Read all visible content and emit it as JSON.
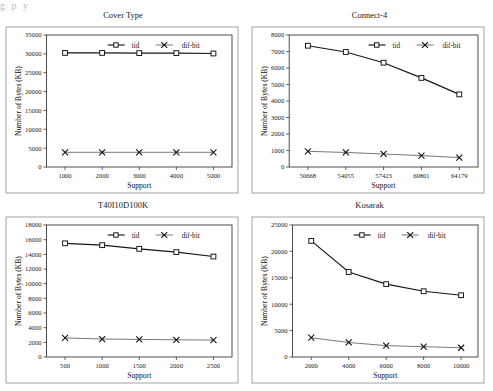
{
  "page": {
    "top_cutoff_text": "g           p           y",
    "axis_x_title": "Support",
    "axis_y_title": "Number of Bytes (KB)",
    "series_names": {
      "tid": "tid",
      "difbit": "dif-bit"
    },
    "colors": {
      "tid": "#161616",
      "difbit": "#4a4a4a",
      "frame": "#8d8d93",
      "axis": "#3b3b3b",
      "background": "#ffffff"
    }
  },
  "chart_data": [
    {
      "type": "line",
      "title": "Cover Type",
      "xlabel": "Support",
      "ylabel": "Number of Bytes (KB)",
      "x": [
        1000,
        2000,
        3000,
        4000,
        5000
      ],
      "xticklabels": [
        "1000",
        "2000",
        "3000",
        "4000",
        "5000"
      ],
      "xlim": [
        500,
        5500
      ],
      "ylim": [
        0,
        35000
      ],
      "yticks": [
        0,
        5000,
        10000,
        15000,
        20000,
        25000,
        30000,
        35000
      ],
      "yticklabels": [
        "0",
        "5000",
        "10000",
        "15000",
        "20000",
        "25000",
        "30000",
        "35000"
      ],
      "grid": false,
      "legend_position": "top-center",
      "series": [
        {
          "name": "tid",
          "marker": "square",
          "values": [
            30250,
            30250,
            30200,
            30200,
            30100
          ]
        },
        {
          "name": "dif-bit",
          "marker": "x",
          "values": [
            3900,
            3900,
            3900,
            3900,
            3900
          ]
        }
      ]
    },
    {
      "type": "line",
      "title": "Connect-4",
      "xlabel": "Support",
      "ylabel": "Number of Bytes (KB)",
      "x": [
        50668,
        54055,
        57423,
        60801,
        64179
      ],
      "xticklabels": [
        "50668",
        "54055",
        "57423",
        "60801",
        "64179"
      ],
      "xlim": [
        49000,
        65850
      ],
      "ylim": [
        0,
        8000
      ],
      "yticks": [
        0,
        1000,
        2000,
        3000,
        4000,
        5000,
        6000,
        7000,
        8000
      ],
      "yticklabels": [
        "0",
        "1000",
        "2000",
        "3000",
        "4000",
        "5000",
        "6000",
        "7000",
        "8000"
      ],
      "grid": false,
      "legend_position": "top-right",
      "series": [
        {
          "name": "tid",
          "marker": "square",
          "values": [
            7350,
            6970,
            6320,
            5400,
            4400
          ]
        },
        {
          "name": "dif-bit",
          "marker": "x",
          "values": [
            950,
            880,
            790,
            690,
            570
          ]
        }
      ]
    },
    {
      "type": "line",
      "title": "T40I10D100K",
      "xlabel": "Support",
      "ylabel": "Number of Bytes (KB)",
      "x": [
        500,
        1000,
        1500,
        2000,
        2500
      ],
      "xticklabels": [
        "500",
        "1000",
        "1500",
        "2000",
        "2500"
      ],
      "xlim": [
        250,
        2750
      ],
      "ylim": [
        0,
        18000
      ],
      "yticks": [
        0,
        2000,
        4000,
        6000,
        8000,
        10000,
        12000,
        14000,
        16000,
        18000
      ],
      "yticklabels": [
        "0",
        "2000",
        "4000",
        "6000",
        "8000",
        "10000",
        "12000",
        "14000",
        "16000",
        "18000"
      ],
      "grid": false,
      "legend_position": "top-center",
      "series": [
        {
          "name": "tid",
          "marker": "square",
          "values": [
            15500,
            15250,
            14750,
            14300,
            13700
          ]
        },
        {
          "name": "dif-bit",
          "marker": "x",
          "values": [
            2600,
            2450,
            2400,
            2350,
            2300
          ]
        }
      ]
    },
    {
      "type": "line",
      "title": "Kosarak",
      "xlabel": "Support",
      "ylabel": "Number of Bytes (KB)",
      "x": [
        2000,
        4000,
        6000,
        8000,
        10000
      ],
      "xticklabels": [
        "2000",
        "4000",
        "6000",
        "8000",
        "10000"
      ],
      "xlim": [
        1000,
        10900
      ],
      "ylim": [
        0,
        25000
      ],
      "yticks": [
        0,
        5000,
        10000,
        15000,
        20000,
        25000
      ],
      "yticklabels": [
        "0",
        "5000",
        "10000",
        "15000",
        "20000",
        "25000"
      ],
      "grid": false,
      "legend_position": "top-center",
      "series": [
        {
          "name": "tid",
          "marker": "square",
          "values": [
            22000,
            16100,
            13800,
            12450,
            11700
          ]
        },
        {
          "name": "dif-bit",
          "marker": "x",
          "values": [
            3650,
            2750,
            2150,
            1950,
            1750
          ]
        }
      ]
    }
  ]
}
